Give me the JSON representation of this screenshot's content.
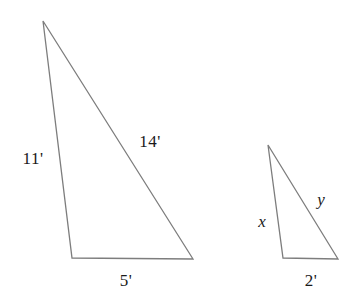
{
  "figure": {
    "stroke_color": "#7d7d7d",
    "label_color": "#1a1a1a",
    "background_color": "#ffffff",
    "stroke_width": 1.3,
    "width": 356,
    "height": 301
  },
  "shapes": [
    {
      "name": "large-triangle",
      "points": "43,21 72,258 193,259",
      "vertices": [
        {
          "name": "apex",
          "x": 43,
          "y": 21
        },
        {
          "name": "bottom-left",
          "x": 72,
          "y": 258
        },
        {
          "name": "bottom-right",
          "x": 193,
          "y": 259
        }
      ]
    },
    {
      "name": "small-triangle",
      "points": "268,145 283,258 338,259",
      "vertices": [
        {
          "name": "apex",
          "x": 268,
          "y": 145
        },
        {
          "name": "bottom-left",
          "x": 283,
          "y": 258
        },
        {
          "name": "bottom-right",
          "x": 338,
          "y": 259
        }
      ]
    }
  ],
  "labels": {
    "large": {
      "left_side": "11'",
      "hypotenuse": "14'",
      "base": "5'"
    },
    "small": {
      "left_side": "x",
      "hypotenuse": "y",
      "base": "2'"
    }
  },
  "label_positions": {
    "large_left": {
      "x": 33,
      "y": 158
    },
    "large_hyp": {
      "x": 150,
      "y": 141
    },
    "large_base": {
      "x": 126,
      "y": 280
    },
    "small_left": {
      "x": 262,
      "y": 221
    },
    "small_hyp": {
      "x": 321,
      "y": 199
    },
    "small_base": {
      "x": 311,
      "y": 280
    }
  }
}
